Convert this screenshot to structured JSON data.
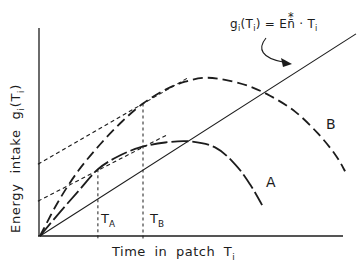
{
  "figure": {
    "ink_color": "#1c1c1c",
    "background_color": "#ffffff",
    "y_axis_label": {
      "p1": "Energy intake g",
      "s1": "i",
      "p2": "(T",
      "s2": "i",
      "p3": ")"
    },
    "x_axis_label": {
      "pre": "Time in patch T",
      "sub": "i"
    },
    "equation": {
      "p1": "g",
      "s1": "i",
      "p2": "(T",
      "s2": "i",
      "p3": ") = E",
      "n": "n̄",
      "star": "*",
      "p4": " · T",
      "s3": "i"
    },
    "labels": {
      "curve_a": "A",
      "curve_b": "B",
      "t_a_main": "T",
      "t_a_sub": "A",
      "t_b_main": "T",
      "t_b_sub": "B"
    }
  },
  "chart_data": {
    "type": "line",
    "title": "",
    "xlabel": "Time in patch Tᵢ",
    "ylabel": "Energy intake gᵢ(Tᵢ)",
    "axes_numeric": false,
    "gridlines": false,
    "legend": false,
    "x_range_normalized": [
      0,
      1
    ],
    "y_range_normalized": [
      0,
      1
    ],
    "annotation_equation": "gᵢ(Tᵢ) = En̄* · Tᵢ",
    "series": [
      {
        "name": "gain-curve-A",
        "style": "dashed-curve-long",
        "x": [
          0,
          0.066,
          0.132,
          0.191,
          0.257,
          0.33,
          0.413,
          0.495,
          0.578,
          0.644,
          0.693,
          0.733
        ],
        "y": [
          0,
          0.116,
          0.227,
          0.324,
          0.386,
          0.43,
          0.454,
          0.459,
          0.43,
          0.348,
          0.251,
          0.15
        ]
      },
      {
        "name": "gain-curve-B",
        "style": "dashed-curve",
        "x": [
          0,
          0.059,
          0.125,
          0.198,
          0.271,
          0.34,
          0.413,
          0.479,
          0.545,
          0.611,
          0.686,
          0.759,
          0.842,
          0.917,
          0.974,
          1.007
        ],
        "y": [
          0,
          0.164,
          0.314,
          0.444,
          0.556,
          0.643,
          0.71,
          0.749,
          0.768,
          0.758,
          0.729,
          0.681,
          0.604,
          0.498,
          0.396,
          0.314
        ]
      },
      {
        "name": "average-rate-line",
        "style": "solid-line",
        "x": [
          0,
          1.043
        ],
        "y": [
          0,
          0.981
        ]
      },
      {
        "name": "tangent-at-TA",
        "style": "short-dash",
        "x": [
          -0.007,
          0.422
        ],
        "y": [
          0.169,
          0.493
        ]
      },
      {
        "name": "tangent-at-TB",
        "style": "short-dash",
        "x": [
          -0.007,
          0.488
        ],
        "y": [
          0.348,
          0.768
        ]
      }
    ],
    "markers": [
      {
        "name": "T_A",
        "x": 0.191,
        "y_top": 0.324
      },
      {
        "name": "T_B",
        "x": 0.34,
        "y_top": 0.643
      }
    ]
  }
}
